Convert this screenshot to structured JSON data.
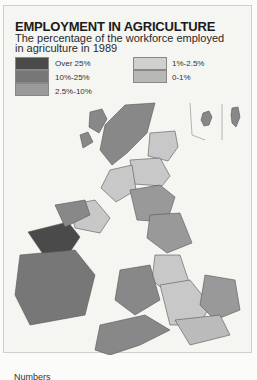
{
  "title": "EMPLOYMENT IN AGRICULTURE",
  "subtitle": "The percentage of the workforce employed in agriculture in 1989",
  "legend": [
    {
      "label": "Over 25%",
      "color": "#4a4a4a"
    },
    {
      "label": "10%-25%",
      "color": "#777777"
    },
    {
      "label": "2.5%-10%",
      "color": "#9a9a9a"
    },
    {
      "label": "1%-2.5%",
      "color": "#c8c8c8"
    },
    {
      "label": "0-1%",
      "color": "#b4b4b4"
    }
  ],
  "footer": "Numbers"
}
